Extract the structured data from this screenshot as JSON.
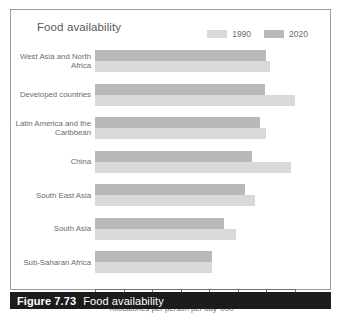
{
  "figure": {
    "caption_number": "Figure 7.73",
    "caption_text": "Food availability"
  },
  "chart_data": {
    "type": "bar",
    "orientation": "horizontal",
    "title": "Food availability",
    "xlabel": "Kilocalories per person per day '000",
    "ylabel": "",
    "xlim": [
      0,
      3.5
    ],
    "xticks": [
      "0",
      "0.5",
      "1.0",
      "1.5",
      "2.0",
      "2.5",
      "3.0",
      "3.5"
    ],
    "xtick_values": [
      0,
      0.5,
      1.0,
      1.5,
      2.0,
      2.5,
      3.0,
      3.5
    ],
    "grid": false,
    "legend_position": "top-right",
    "categories": [
      "West Asia and North Africa",
      "Developed countries",
      "Latin America and the Caribbean",
      "China",
      "South East Asia",
      "South Asia",
      "Sub-Saharan Africa"
    ],
    "series": [
      {
        "name": "2020",
        "color": "#b9b9b9",
        "values": [
          3.0,
          2.97,
          2.88,
          2.75,
          2.63,
          2.25,
          2.05
        ]
      },
      {
        "name": "1990",
        "color": "#d9d9d9",
        "values": [
          3.07,
          3.5,
          3.0,
          3.43,
          2.8,
          2.47,
          2.05
        ]
      }
    ]
  }
}
